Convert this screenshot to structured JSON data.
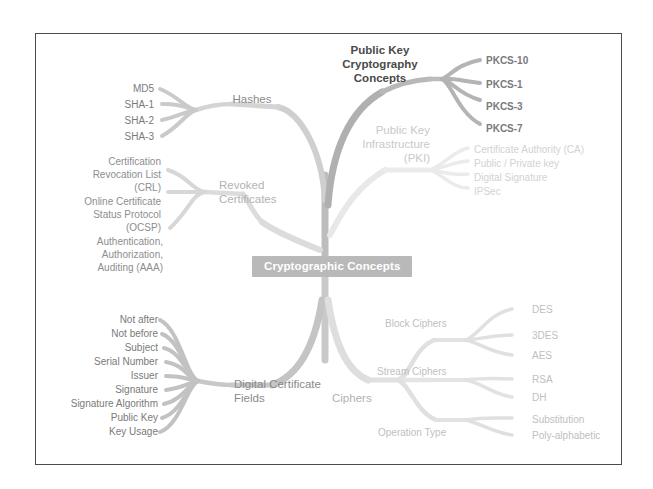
{
  "diagram": {
    "type": "mind-map",
    "title": "Cryptographic Concepts",
    "center": {
      "label": "Cryptographic Concepts",
      "color": "#b9b9b9",
      "text_color": "#ffffff"
    },
    "branches": [
      {
        "id": "hashes",
        "label": "Hashes",
        "color": "#c4c4c4",
        "children": [
          {
            "label": "MD5"
          },
          {
            "label": "SHA-1"
          },
          {
            "label": "SHA-2"
          },
          {
            "label": "SHA-3"
          }
        ]
      },
      {
        "id": "revoked-certificates",
        "label": "Revoked\nCertificates",
        "line1": "Revoked",
        "line2": "Certificates",
        "color": "#cfcfcf",
        "children": [
          {
            "line1": "Certification",
            "line2": "Revocation List",
            "line3": "(CRL)"
          },
          {
            "line1": "Online Certificate",
            "line2": "Status Protocol",
            "line3": "(OCSP)"
          },
          {
            "line1": "Authentication,",
            "line2": "Authorization,",
            "line3": "Auditing (AAA)"
          }
        ]
      },
      {
        "id": "public-key-cryptography-concepts",
        "label": "Public Key\nCryptography\nConcepts",
        "line1": "Public Key",
        "line2": "Cryptography",
        "line3": "Concepts",
        "color": "#a8a8a8",
        "children": [
          {
            "label": "PKCS-10"
          },
          {
            "label": "PKCS-1"
          },
          {
            "label": "PKCS-3"
          },
          {
            "label": "PKCS-7"
          }
        ]
      },
      {
        "id": "public-key-infrastructure",
        "label": "Public Key\nInfrastructure\n(PKI)",
        "line1": "Public Key",
        "line2": "Infrastructure",
        "line3": "(PKI)",
        "color": "#e2e2e2",
        "children": [
          {
            "label": "Certificate Authority (CA)"
          },
          {
            "label": "Public / Private key"
          },
          {
            "label": "Digital Signature"
          },
          {
            "label": "IPSec"
          }
        ]
      },
      {
        "id": "digital-certificate-fields",
        "label": "Digital Certificate\nFields",
        "line1": "Digital Certificate",
        "line2": "Fields",
        "color": "#bcbcbc",
        "children": [
          {
            "label": "Not after"
          },
          {
            "label": "Not before"
          },
          {
            "label": "Subject"
          },
          {
            "label": "Serial Number"
          },
          {
            "label": "Issuer"
          },
          {
            "label": "Signature"
          },
          {
            "label": "Signature Algorithm"
          },
          {
            "label": "Public Key"
          },
          {
            "label": "Key Usage"
          }
        ]
      },
      {
        "id": "ciphers",
        "label": "Ciphers",
        "color": "#d8d8d8",
        "subbranches": [
          {
            "id": "block-ciphers",
            "label": "Block Ciphers",
            "children": [
              {
                "label": "DES"
              },
              {
                "label": "3DES"
              },
              {
                "label": "AES"
              }
            ]
          },
          {
            "id": "stream-ciphers",
            "label": "Stream Ciphers",
            "children": [
              {
                "label": "RSA"
              },
              {
                "label": "DH"
              }
            ]
          },
          {
            "id": "operation-type",
            "label": "Operation Type",
            "children": [
              {
                "label": "Substitution"
              },
              {
                "label": "Poly-alphabetic"
              }
            ]
          }
        ]
      }
    ]
  }
}
